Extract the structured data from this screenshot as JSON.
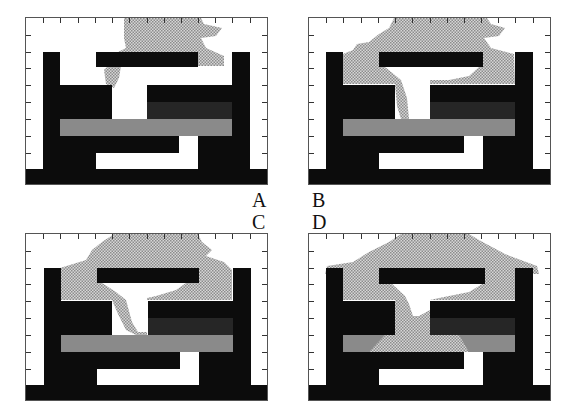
{
  "figure": {
    "panels": [
      {
        "id": "A",
        "label": "A",
        "fluid_stage": "early",
        "description": "Fluid plume above top bar, left side wraps down slightly"
      },
      {
        "id": "B",
        "label": "B",
        "fluid_stage": "intrusion",
        "description": "Fluid fills upper cavity and begins descending through central channel"
      },
      {
        "id": "C",
        "label": "C",
        "fluid_stage": "descending",
        "description": "Fluid fills upper cavity, penetrates central channel down to grey bar"
      },
      {
        "id": "D",
        "label": "D",
        "fluid_stage": "breakthrough",
        "description": "Fluid spreads over pillars and breaks through grey layer"
      }
    ],
    "colors": {
      "background": "#ffffff",
      "solid": "#0c0c0c",
      "dark_layer": "#262626",
      "grey_layer": "#8a8a8a",
      "fluid": "#b4b4b4"
    },
    "axes": {
      "top_ticks": 13,
      "side_ticks": 8
    }
  }
}
